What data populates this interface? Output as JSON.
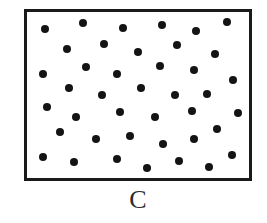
{
  "figure": {
    "caption": "C",
    "caption_font_size_px": 26,
    "caption_center_x": 138,
    "caption_baseline_y": 213,
    "colors": {
      "background": "#ffffff",
      "box_fill": "#ffffff",
      "box_border": "#1a1a1a",
      "dot": "#141414",
      "caption": "#2b2b2b"
    },
    "box": {
      "x": 24,
      "y": 9,
      "width": 228,
      "height": 172,
      "border_width": 3
    },
    "dot": {
      "diameter": 8,
      "count": 41,
      "shape": "circle"
    },
    "dots": [
      {
        "cx": 45,
        "cy": 29
      },
      {
        "cx": 83,
        "cy": 23
      },
      {
        "cx": 123,
        "cy": 28
      },
      {
        "cx": 162,
        "cy": 25
      },
      {
        "cx": 196,
        "cy": 31
      },
      {
        "cx": 227,
        "cy": 22
      },
      {
        "cx": 67,
        "cy": 49
      },
      {
        "cx": 104,
        "cy": 44
      },
      {
        "cx": 138,
        "cy": 52
      },
      {
        "cx": 177,
        "cy": 45
      },
      {
        "cx": 215,
        "cy": 54
      },
      {
        "cx": 43,
        "cy": 74
      },
      {
        "cx": 86,
        "cy": 67
      },
      {
        "cx": 117,
        "cy": 74
      },
      {
        "cx": 160,
        "cy": 66
      },
      {
        "cx": 194,
        "cy": 70
      },
      {
        "cx": 233,
        "cy": 80
      },
      {
        "cx": 69,
        "cy": 88
      },
      {
        "cx": 102,
        "cy": 95
      },
      {
        "cx": 141,
        "cy": 88
      },
      {
        "cx": 175,
        "cy": 95
      },
      {
        "cx": 207,
        "cy": 94
      },
      {
        "cx": 47,
        "cy": 107
      },
      {
        "cx": 76,
        "cy": 117
      },
      {
        "cx": 120,
        "cy": 112
      },
      {
        "cx": 155,
        "cy": 117
      },
      {
        "cx": 192,
        "cy": 111
      },
      {
        "cx": 238,
        "cy": 113
      },
      {
        "cx": 60,
        "cy": 132
      },
      {
        "cx": 96,
        "cy": 139
      },
      {
        "cx": 130,
        "cy": 136
      },
      {
        "cx": 163,
        "cy": 144
      },
      {
        "cx": 194,
        "cy": 139
      },
      {
        "cx": 217,
        "cy": 129
      },
      {
        "cx": 43,
        "cy": 157
      },
      {
        "cx": 74,
        "cy": 162
      },
      {
        "cx": 117,
        "cy": 159
      },
      {
        "cx": 147,
        "cy": 168
      },
      {
        "cx": 179,
        "cy": 161
      },
      {
        "cx": 209,
        "cy": 167
      },
      {
        "cx": 232,
        "cy": 155
      }
    ]
  }
}
